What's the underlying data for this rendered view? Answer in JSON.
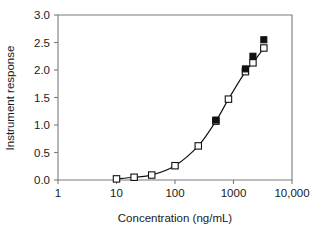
{
  "chart_data": {
    "type": "scatter",
    "title": "",
    "xlabel": "Concentration (ng/mL)",
    "ylabel": "Instrument response",
    "xscale": "log",
    "yscale": "linear",
    "xlim": [
      1,
      10000
    ],
    "ylim": [
      0.0,
      3.0
    ],
    "grid": false,
    "legend": "none",
    "xticks": [
      1,
      10,
      100,
      1000,
      10000
    ],
    "xticklabels": [
      "1",
      "10",
      "100",
      "1000",
      "10,000"
    ],
    "yticks": [
      0.0,
      0.5,
      1.0,
      1.5,
      2.0,
      2.5,
      3.0
    ],
    "yticklabels": [
      "0.0",
      "0.5",
      "1.0",
      "1.5",
      "2.0",
      "2.5",
      "3.0"
    ],
    "series": [
      {
        "name": "open-squares",
        "marker": "open-square",
        "connected": true,
        "x": [
          10,
          20,
          40,
          100,
          250,
          500,
          820,
          1600,
          2150,
          3300
        ],
        "y": [
          0.02,
          0.05,
          0.09,
          0.26,
          0.62,
          1.07,
          1.47,
          1.97,
          2.13,
          2.4
        ]
      },
      {
        "name": "filled-squares",
        "marker": "filled-square",
        "connected": false,
        "x": [
          500,
          1600,
          2150,
          3300
        ],
        "y": [
          1.09,
          2.02,
          2.25,
          2.55
        ]
      }
    ]
  },
  "axes": {
    "x_title": "Concentration (ng/mL)",
    "y_title": "Instrument response"
  }
}
